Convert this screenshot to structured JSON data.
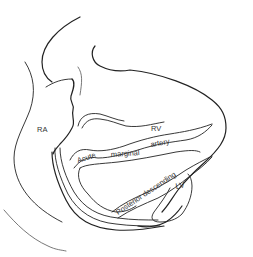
{
  "diagram": {
    "type": "anatomical-line-drawing",
    "labels": {
      "ra": "RA",
      "rv": "RV",
      "acute": "Acute",
      "marginal": "marginal",
      "artery": "artery",
      "posterior_descending": "Posterior descending",
      "lv": "LV"
    },
    "colors": {
      "line": "#222222",
      "text": "#333333",
      "background": "#ffffff"
    }
  }
}
